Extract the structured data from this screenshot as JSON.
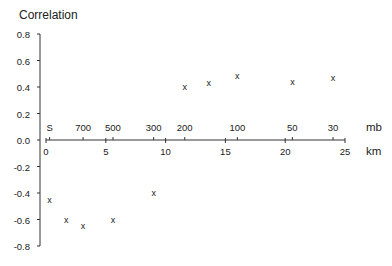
{
  "chart_data": {
    "type": "scatter",
    "title": "",
    "ylabel": "Correlation",
    "xlabel": "km",
    "secondary_xlabel": "mb",
    "ylim": [
      -0.8,
      0.8
    ],
    "xlim": [
      0,
      25
    ],
    "grid": false,
    "marker": "x",
    "yticks": [
      "0.8",
      "0.6",
      "0.4",
      "0.2",
      "0.0",
      "-0.2",
      "-0.4",
      "-0.6",
      "-0.8"
    ],
    "xticks_km": [
      "0",
      "5",
      "10",
      "15",
      "20",
      "25"
    ],
    "xticks_mb": [
      {
        "label": "S",
        "km": 0.3
      },
      {
        "label": "700",
        "km": 3.1
      },
      {
        "label": "500",
        "km": 5.6
      },
      {
        "label": "300",
        "km": 9.0
      },
      {
        "label": "200",
        "km": 11.6
      },
      {
        "label": "100",
        "km": 16.0
      },
      {
        "label": "50",
        "km": 20.6
      },
      {
        "label": "30",
        "km": 24.0
      }
    ],
    "x": [
      0.3,
      1.7,
      3.1,
      5.6,
      9.0,
      11.6,
      13.6,
      16.0,
      20.6,
      24.0
    ],
    "y": [
      -0.45,
      -0.6,
      -0.65,
      -0.6,
      -0.4,
      0.4,
      0.43,
      0.48,
      0.44,
      0.47
    ]
  }
}
